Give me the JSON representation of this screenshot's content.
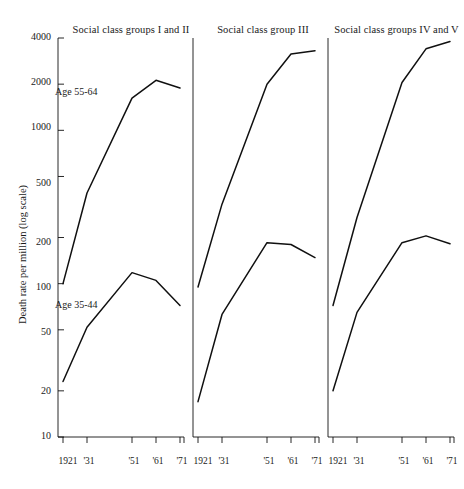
{
  "chart_data": {
    "type": "line",
    "title": "",
    "ylabel": "Death rate per million (log scale)",
    "xlabel": "",
    "scale": "log",
    "ylim": [
      10,
      4000
    ],
    "grid": false,
    "legend": "inline-annotations",
    "y_ticks": [
      10,
      20,
      50,
      100,
      200,
      500,
      1000,
      2000,
      4000
    ],
    "y_tick_labels": [
      "10",
      "20",
      "50",
      "100",
      "200",
      "500",
      "1000",
      "2000",
      "4000"
    ],
    "x": [
      1921,
      1931,
      1951,
      1961,
      1971
    ],
    "x_tick_labels": [
      "1921",
      "'31",
      "'51",
      "'61",
      "'71"
    ],
    "panels": [
      {
        "title": "Social class groups I and II",
        "series": [
          {
            "name": "Age 55-64",
            "label_shown": "Age 55-64",
            "values": [
              100,
              390,
              1620,
              2120,
              1890
            ]
          },
          {
            "name": "Age 35-44",
            "label_shown": "Age 35-44",
            "values": [
              23,
              52,
              118,
              105,
              72
            ]
          }
        ]
      },
      {
        "title": "Social class group III",
        "series": [
          {
            "name": "Age 55-64",
            "label_shown": "",
            "values": [
              95,
              330,
              2000,
              3150,
              3300
            ]
          },
          {
            "name": "Age 35-44",
            "label_shown": "",
            "values": [
              17,
              63,
              185,
              180,
              148
            ]
          }
        ]
      },
      {
        "title": "Social class groups IV and V",
        "series": [
          {
            "name": "Age 55-64",
            "label_shown": "",
            "values": [
              72,
              270,
              2050,
              3400,
              3800
            ]
          },
          {
            "name": "Age 35-44",
            "label_shown": "",
            "values": [
              20,
              65,
              185,
              205,
              182
            ]
          }
        ]
      }
    ]
  },
  "axis": {
    "y_title": "Death rate per million (log scale)",
    "y_labels": [
      "4000",
      "2000",
      "1000",
      "500",
      "200",
      "100",
      "50",
      "20",
      "10"
    ],
    "x_labels": [
      "1921",
      "'31",
      "'51",
      "'61",
      "'71"
    ]
  },
  "panel_titles": {
    "p1": "Social class groups I and II",
    "p2": "Social class group III",
    "p3": "Social class groups IV and V"
  },
  "series_labels": {
    "older": "Age 55-64",
    "younger": "Age 35-44"
  },
  "colors": {
    "line": "#101010",
    "axis": "#101010",
    "background": "#ffffff"
  }
}
